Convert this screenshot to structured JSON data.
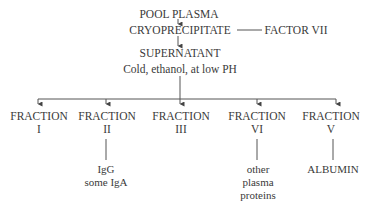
{
  "diagram": {
    "top": {
      "pool_plasma": "POOL PLASMA",
      "cryoprecipitate": "CRYOPRECIPITATE",
      "factor": "FACTOR VII",
      "supernatant": "SUPERNATANT",
      "condition": "Cold, ethanol, at low PH"
    },
    "fractions": [
      {
        "label": "FRACTION",
        "numeral": "I",
        "products": []
      },
      {
        "label": "FRACTION",
        "numeral": "II",
        "products": [
          "IgG",
          "some IgA"
        ]
      },
      {
        "label": "FRACTION",
        "numeral": "III",
        "products": []
      },
      {
        "label": "FRACTION",
        "numeral": "VI",
        "products": [
          "other",
          "plasma",
          "proteins"
        ]
      },
      {
        "label": "FRACTION",
        "numeral": "V",
        "products": [
          "ALBUMIN"
        ]
      }
    ],
    "colors": {
      "line": "#555555",
      "text": "#3a3a3a"
    }
  }
}
